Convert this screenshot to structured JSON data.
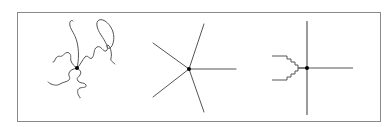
{
  "diagram": {
    "frame": {
      "x": 17,
      "y": 12,
      "width": 364,
      "height": 110,
      "stroke": "#8a8a8a"
    },
    "colors": {
      "line": "#555555",
      "node": "#000000",
      "frame": "#8a8a8a",
      "background": "#ffffff"
    },
    "figures": [
      {
        "id": "flexible-star",
        "label": "Star with flexible (coiled) arms",
        "center": [
          77,
          68
        ],
        "arm_count": 5
      },
      {
        "id": "rigid-star",
        "label": "Star with straight arms",
        "center": [
          189,
          69
        ],
        "arms": [
          [
            204,
            24
          ],
          [
            153,
            43
          ],
          [
            236,
            69
          ],
          [
            153,
            97
          ],
          [
            204,
            112
          ]
        ]
      },
      {
        "id": "stepped-branch",
        "label": "Cross junction with stepped (staircase) arms",
        "center": [
          307,
          68
        ],
        "vertical": {
          "x": 307,
          "y1": 21,
          "y2": 115
        },
        "horizontal": {
          "x2": 353,
          "y": 68
        },
        "step_arms": 2
      }
    ]
  }
}
